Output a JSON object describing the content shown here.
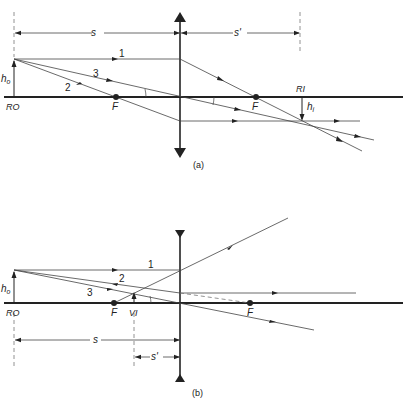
{
  "diagram_a": {
    "caption": "(a)",
    "type": "converging lens, real image",
    "labels": {
      "object": "RO",
      "image": "RI",
      "focal_left": "F",
      "focal_right": "F",
      "object_height": "h",
      "object_height_sub": "o",
      "image_height": "h",
      "image_height_sub": "i",
      "object_distance": "s",
      "image_distance": "s'",
      "ray1": "1",
      "ray2": "2",
      "ray3": "3"
    }
  },
  "diagram_b": {
    "caption": "(b)",
    "type": "diverging lens, virtual image",
    "labels": {
      "object": "RO",
      "image": "VI",
      "focal_left": "F",
      "focal_right": "F",
      "object_height": "h",
      "object_height_sub": "o",
      "object_distance": "s",
      "image_distance": "s'",
      "ray1": "1",
      "ray2": "2",
      "ray3": "3"
    }
  },
  "colors": {
    "line": "#222222",
    "ray": "#444444",
    "dash": "#777777"
  }
}
